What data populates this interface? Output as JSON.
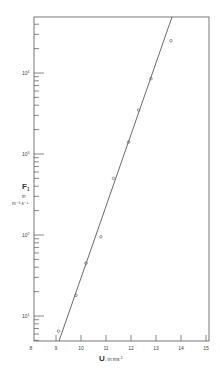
{
  "chart_data": {
    "type": "scatter",
    "title": "",
    "xlabel": "U, in ms⁻¹",
    "ylabel": "F₁ in m⁻² s⁻¹",
    "xscale": "linear",
    "yscale": "log",
    "xlim": [
      8,
      15
    ],
    "ylim": [
      5,
      50000
    ],
    "grid": false,
    "legend": null,
    "x_ticks": [
      "8",
      "9",
      "10",
      "11",
      "12",
      "13",
      "14",
      "15"
    ],
    "y_ticks": [
      "10¹",
      "10²",
      "10³",
      "10⁴"
    ],
    "series": [
      {
        "name": "observations",
        "marker": "open-circle",
        "x": [
          9.1,
          9.8,
          10.2,
          10.8,
          11.3,
          11.9,
          12.3,
          12.8,
          13.6
        ],
        "y": [
          6.5,
          18,
          45,
          95,
          500,
          1400,
          3500,
          8500,
          25000
        ]
      },
      {
        "name": "fit-line",
        "style": "line",
        "x": [
          9.1,
          13.6
        ],
        "y": [
          5,
          50000
        ]
      }
    ]
  },
  "axes": {
    "x_title_main": "U",
    "x_title_unit": ", in ms",
    "x_title_sup": "-1",
    "y_title_main": "F",
    "y_title_sub": "1",
    "y_title_in": "in",
    "y_title_unit": "m⁻² s⁻¹",
    "x_tick_labels": [
      "8",
      "9",
      "10",
      "11",
      "12",
      "13",
      "14",
      "15"
    ],
    "y_decade_base": "10",
    "y_decade_exps": [
      "1",
      "2",
      "3",
      "4"
    ]
  }
}
